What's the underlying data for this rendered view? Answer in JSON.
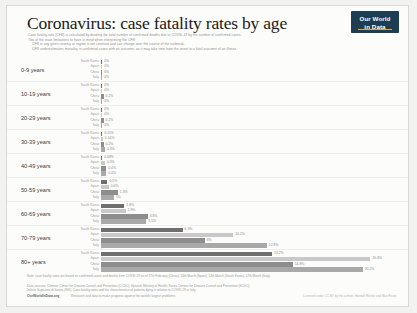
{
  "header": {
    "title": "Coronavirus: case fatality rates by age",
    "subtitle_lines": [
      "Case fatality rate (CFR) is calculated by dividing the total number of confirmed deaths due to COVID-19 by the number of confirmed cases.",
      "Two of the main limitations to have in mind when interpreting the CFR:",
      "CFR in any given country or region is not constant and can change over the course of the outbreak.",
      "CFR underestimates mortality in confirmed cases with an outcome, as it may take time from the onset to a fatal outcome of an illness."
    ],
    "logo": {
      "line1": "Our World",
      "line2": "in Data"
    }
  },
  "chart_data": {
    "type": "bar",
    "orientation": "horizontal",
    "title": "Coronavirus: case fatality rates by age",
    "xlabel": "",
    "ylabel": "",
    "xlim": [
      0,
      22
    ],
    "grid": false,
    "legend": "inline-row-labels",
    "categories": [
      "0-9 years",
      "10-19 years",
      "20-29 years",
      "30-39 years",
      "40-49 years",
      "50-59 years",
      "60-69 years",
      "70-79 years",
      "80+ years"
    ],
    "entities": [
      "South Korea",
      "Spain",
      "China",
      "Italy"
    ],
    "colors": {
      "South Korea": "#6f6f6f",
      "Spain": "#c9c9c9",
      "China": "#8d8d8d",
      "Italy": "#a9a9a9"
    },
    "series": [
      {
        "name": "South Korea",
        "values": [
          0.0,
          0.0,
          0.0,
          0.11,
          0.08,
          0.5,
          1.8,
          6.3,
          13.2
        ],
        "labels": [
          "0%",
          "0%",
          "0%",
          "0.11%",
          "0.08%",
          "0.5%",
          "1.8%",
          "6.3%",
          "13.2%"
        ]
      },
      {
        "name": "Spain",
        "values": [
          0.0,
          0.0,
          0.0,
          0.14,
          0.3,
          0.6,
          1.9,
          10.2,
          20.8
        ],
        "labels": [
          "0%",
          "0%",
          "0%",
          "0.14%",
          "0.3%",
          "0.6%",
          "1.9%",
          "10.2%",
          "20.8%"
        ]
      },
      {
        "name": "China",
        "values": [
          0.0,
          0.2,
          0.2,
          0.2,
          0.4,
          1.3,
          3.6,
          8.0,
          14.8
        ],
        "labels": [
          "0%",
          "0.2%",
          "0.2%",
          "0.2%",
          "0.4%",
          "1.3%",
          "3.6%",
          "8%",
          "14.8%"
        ]
      },
      {
        "name": "Italy",
        "values": [
          0.0,
          0.0,
          0.0,
          0.3,
          0.4,
          1.0,
          3.5,
          12.8,
          20.2
        ],
        "labels": [
          "0%",
          "0%",
          "0%",
          "0.3%",
          "0.4%",
          "1%",
          "3.5%",
          "12.8%",
          "20.2%"
        ]
      }
    ]
  },
  "footer": {
    "note": "Note: case fatality rates are based on confirmed cases and deaths from COVID-19 as of 17th February (China), 24th March (Spain), 14th March (South Korea), 17th March (Italy).",
    "source_lines": [
      "Data sources: Chinese Center for Disease Control and Prevention (CCDC); Spanish Ministry of Health; Korea Centers for Disease Control and Prevention (KCDC);",
      "Istituto Superiore di Sanita (ISS). Case fatality rates and the characteristics of patients dying in relation to COVID-19 in Italy."
    ],
    "owid": "OurWorldInData.org",
    "tagline": "Research and data to make progress against the world's largest problems.",
    "licence": "Licensed under CC-BY by the authors Hannah Ritchie and Max Roser."
  }
}
